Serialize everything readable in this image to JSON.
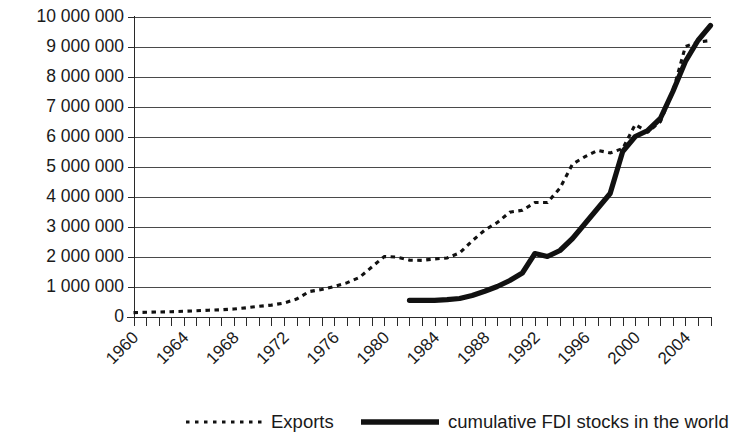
{
  "chart_data": {
    "type": "line",
    "title": "",
    "subtitle": "",
    "xlabel": "",
    "ylabel": "",
    "xlim": [
      1960,
      2006
    ],
    "ylim": [
      0,
      10000000
    ],
    "grid": true,
    "legend_position": "bottom",
    "y_tick_labels": [
      "10 000 000",
      "9 000 000",
      "8 000 000",
      "7 000 000",
      "6 000 000",
      "5 000 000",
      "4 000 000",
      "3 000 000",
      "2 000 000",
      "1 000 000",
      "0"
    ],
    "y_tick_values": [
      10000000,
      9000000,
      8000000,
      7000000,
      6000000,
      5000000,
      4000000,
      3000000,
      2000000,
      1000000,
      0
    ],
    "x_tick_labels": [
      "1960",
      "1964",
      "1968",
      "1972",
      "1976",
      "1980",
      "1984",
      "1988",
      "1992",
      "1996",
      "2000",
      "2004"
    ],
    "x_tick_values": [
      1960,
      1964,
      1968,
      1972,
      1976,
      1980,
      1984,
      1988,
      1992,
      1996,
      2000,
      2004
    ],
    "x_minor_tick_step": 1,
    "x": [
      1960,
      1961,
      1962,
      1963,
      1964,
      1965,
      1966,
      1967,
      1968,
      1969,
      1970,
      1971,
      1972,
      1973,
      1974,
      1975,
      1976,
      1977,
      1978,
      1979,
      1980,
      1981,
      1982,
      1983,
      1984,
      1985,
      1986,
      1987,
      1988,
      1989,
      1990,
      1991,
      1992,
      1993,
      1994,
      1995,
      1996,
      1997,
      1998,
      1999,
      2000,
      2001,
      2002,
      2003,
      2004,
      2005,
      2006
    ],
    "series": [
      {
        "name": "Exports",
        "style": "dotted",
        "color": "#111111",
        "values": [
          130000,
          140000,
          150000,
          160000,
          175000,
          190000,
          210000,
          225000,
          250000,
          290000,
          340000,
          380000,
          450000,
          580000,
          830000,
          900000,
          1000000,
          1120000,
          1300000,
          1650000,
          2000000,
          1980000,
          1880000,
          1870000,
          1920000,
          1950000,
          2120000,
          2520000,
          2880000,
          3130000,
          3480000,
          3540000,
          3800000,
          3800000,
          4280000,
          5080000,
          5330000,
          5540000,
          5450000,
          5600000,
          6400000,
          6150000,
          6490000,
          7500000,
          9000000,
          9150000,
          9200000
        ]
      },
      {
        "name": "cumulative FDI stocks in the world",
        "style": "solid",
        "color": "#111111",
        "values": [
          null,
          null,
          null,
          null,
          null,
          null,
          null,
          null,
          null,
          null,
          null,
          null,
          null,
          null,
          null,
          null,
          null,
          null,
          null,
          null,
          null,
          null,
          540000,
          540000,
          540000,
          560000,
          600000,
          700000,
          840000,
          1000000,
          1200000,
          1450000,
          2100000,
          2000000,
          2200000,
          2600000,
          3100000,
          3600000,
          4100000,
          5500000,
          6000000,
          6200000,
          6600000,
          7500000,
          8500000,
          9200000,
          9700000
        ]
      }
    ]
  },
  "legend": {
    "items": [
      {
        "label": "Exports",
        "style": "dotted"
      },
      {
        "label": "cumulative FDI stocks in the world",
        "style": "solid"
      }
    ]
  }
}
